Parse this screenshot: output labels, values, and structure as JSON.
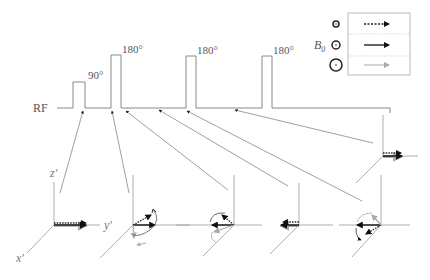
{
  "sequence": {
    "channel_label": "RF",
    "pulses": [
      {
        "label": "90°",
        "type": "excitation"
      },
      {
        "label": "180°",
        "type": "refocusing"
      },
      {
        "label": "180°",
        "type": "refocusing"
      },
      {
        "label": "180°",
        "type": "refocusing"
      }
    ]
  },
  "legend": {
    "field_label": "B",
    "field_subscript": "0",
    "rows": [
      {
        "circle": "small",
        "arrow_style": "dotted",
        "color": "#222222"
      },
      {
        "circle": "medium",
        "arrow_style": "solid",
        "color": "#111111"
      },
      {
        "circle": "large",
        "arrow_style": "solid-light",
        "color": "#bbbbbb"
      }
    ]
  },
  "frames": {
    "axis_labels": {
      "z": "z′",
      "y": "y′",
      "x": "x′"
    },
    "count": 6
  },
  "colors": {
    "line": "#888888",
    "dark_arrow": "#111111",
    "light_arrow": "#aaaaaa"
  }
}
